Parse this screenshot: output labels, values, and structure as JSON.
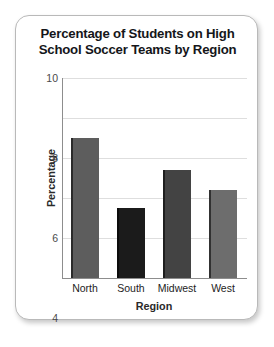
{
  "chart_data": {
    "type": "bar",
    "title": "Percentage of Students on High School Soccer Teams by Region",
    "title_lines": [
      "Percentage of Students on High",
      "School Soccer Teams by Region"
    ],
    "categories": [
      "North",
      "South",
      "Midwest",
      "West"
    ],
    "values": [
      7.0,
      3.5,
      5.4,
      4.4
    ],
    "series": [
      {
        "name": "Percentage of students on soccer teams",
        "values": [
          7.0,
          3.5,
          5.4,
          4.4
        ]
      }
    ],
    "xlabel": "Region",
    "ylabel": "Percentage",
    "ylim": [
      0,
      10
    ],
    "ytick_labels": [
      "0",
      "2",
      "4",
      "6",
      "8",
      "10"
    ],
    "ytick_values": [
      0,
      2,
      4,
      6,
      8,
      10
    ],
    "grid": true,
    "legend": false,
    "bar_colors": [
      "#5d5d5d",
      "#1b1b1b",
      "#434343",
      "#6d6d6d"
    ],
    "gridline_color": "#dedede",
    "axis_color": "#8d8d8d",
    "card_border_color": "#b9b9b9",
    "background_color": "#ffffff"
  }
}
